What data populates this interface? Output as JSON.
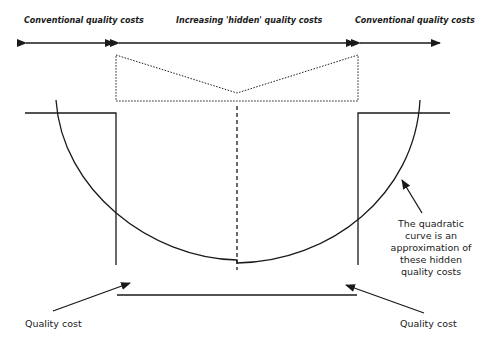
{
  "labels": {
    "top_left": "Conventional quality costs",
    "top_center": "Increasing 'hidden' quality costs",
    "top_right": "Conventional quality costs",
    "curve_note": "The quadratic curve is an approximation of these hidden quality costs",
    "bottom_left": "Quality cost",
    "bottom_right": "Quality cost"
  },
  "colors": {
    "line": "#1a1a1a",
    "background": "#ffffff"
  }
}
